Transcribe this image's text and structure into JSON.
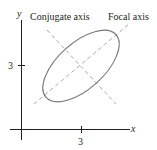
{
  "diagram": {
    "type": "rotated-ellipse-with-axes",
    "labels": {
      "conjugate_axis": "Conjugate axis",
      "focal_axis": "Focal axis",
      "x_axis": "x",
      "y_axis": "y"
    },
    "ticks": {
      "x_tick": "3",
      "y_tick": "3"
    },
    "colors": {
      "axis": "#231f20",
      "ellipse": "#777777",
      "dashed_lines": "#aaaaaa",
      "text": "#231f20"
    }
  }
}
